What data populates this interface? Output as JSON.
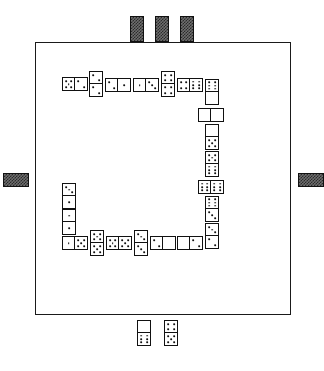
{
  "app": {
    "title": "Dominoes",
    "board_label": "Domino Table"
  },
  "colors": {
    "board_border": "#1a1a1a",
    "tile_face": "#ffffff",
    "tile_border": "#111111",
    "pip": "#111111",
    "tile_back": "#6e6e6e",
    "tile_back_hatch": "#2b2b2b",
    "page_background": "#ffffff"
  },
  "board": {
    "x": 35,
    "y": 42,
    "width": 256,
    "height": 273
  },
  "layout": {
    "tile_long": 22,
    "tile_short": 13
  },
  "layout_chain_note": "Played dominoes form an open rectangle snake running clockwise from upper-left",
  "chain": [
    {
      "id": "chain-tile-1",
      "name": "domino-5-2",
      "values": [
        5,
        2
      ],
      "orientation": "horizontal",
      "x": 62,
      "y": 77,
      "w": 26,
      "h": 14
    },
    {
      "id": "chain-tile-2",
      "name": "domino-2-2",
      "values": [
        2,
        2
      ],
      "orientation": "vertical",
      "x": 89,
      "y": 71,
      "w": 14,
      "h": 26
    },
    {
      "id": "chain-tile-3",
      "name": "domino-2-1",
      "values": [
        2,
        1
      ],
      "orientation": "horizontal",
      "x": 105,
      "y": 78,
      "w": 26,
      "h": 14
    },
    {
      "id": "chain-tile-4",
      "name": "domino-1-3",
      "values": [
        1,
        3
      ],
      "orientation": "horizontal",
      "x": 133,
      "y": 78,
      "w": 26,
      "h": 14
    },
    {
      "id": "chain-tile-5",
      "name": "domino-4-4",
      "values": [
        4,
        4
      ],
      "orientation": "vertical",
      "x": 161,
      "y": 71,
      "w": 14,
      "h": 26
    },
    {
      "id": "chain-tile-6",
      "name": "domino-4-6",
      "values": [
        4,
        6
      ],
      "orientation": "horizontal",
      "x": 177,
      "y": 78,
      "w": 26,
      "h": 14
    },
    {
      "id": "chain-tile-7",
      "name": "domino-6-blank",
      "values": [
        6,
        0
      ],
      "orientation": "vertical",
      "x": 205,
      "y": 79,
      "w": 14,
      "h": 26
    },
    {
      "id": "chain-tile-8",
      "name": "domino-blank-blank",
      "values": [
        0,
        0
      ],
      "orientation": "horizontal",
      "x": 198,
      "y": 108,
      "w": 26,
      "h": 14
    },
    {
      "id": "chain-tile-9",
      "name": "domino-blank-5",
      "values": [
        0,
        5
      ],
      "orientation": "vertical",
      "x": 205,
      "y": 124,
      "w": 14,
      "h": 26
    },
    {
      "id": "chain-tile-10",
      "name": "domino-5-6",
      "values": [
        5,
        6
      ],
      "orientation": "vertical",
      "x": 205,
      "y": 151,
      "w": 14,
      "h": 26
    },
    {
      "id": "chain-tile-11",
      "name": "domino-6-6",
      "values": [
        6,
        6
      ],
      "orientation": "horizontal",
      "x": 198,
      "y": 180,
      "w": 26,
      "h": 14
    },
    {
      "id": "chain-tile-12",
      "name": "domino-6-3",
      "values": [
        6,
        3
      ],
      "orientation": "vertical",
      "x": 205,
      "y": 196,
      "w": 14,
      "h": 26
    },
    {
      "id": "chain-tile-13",
      "name": "domino-3-2",
      "values": [
        3,
        2
      ],
      "orientation": "vertical",
      "x": 205,
      "y": 223,
      "w": 14,
      "h": 26
    },
    {
      "id": "chain-tile-14",
      "name": "domino-blank-2",
      "values": [
        0,
        2
      ],
      "orientation": "horizontal",
      "x": 177,
      "y": 236,
      "w": 26,
      "h": 14
    },
    {
      "id": "chain-tile-15",
      "name": "domino-2-blank",
      "values": [
        2,
        0
      ],
      "orientation": "horizontal",
      "x": 150,
      "y": 236,
      "w": 26,
      "h": 14
    },
    {
      "id": "chain-tile-16",
      "name": "domino-3-3",
      "values": [
        3,
        3
      ],
      "orientation": "vertical",
      "x": 134,
      "y": 230,
      "w": 14,
      "h": 26
    },
    {
      "id": "chain-tile-17",
      "name": "domino-5-5",
      "values": [
        5,
        5
      ],
      "orientation": "horizontal",
      "x": 106,
      "y": 236,
      "w": 26,
      "h": 14
    },
    {
      "id": "chain-tile-18",
      "name": "domino-5-5-b",
      "values": [
        5,
        5
      ],
      "orientation": "vertical",
      "x": 90,
      "y": 230,
      "w": 14,
      "h": 26
    },
    {
      "id": "chain-tile-19",
      "name": "domino-1-5",
      "values": [
        1,
        5
      ],
      "orientation": "horizontal",
      "x": 62,
      "y": 236,
      "w": 26,
      "h": 14
    },
    {
      "id": "chain-tile-20",
      "name": "domino-1-1",
      "values": [
        1,
        1
      ],
      "orientation": "vertical",
      "x": 62,
      "y": 209,
      "w": 14,
      "h": 26
    },
    {
      "id": "chain-tile-21",
      "name": "domino-3-1",
      "values": [
        3,
        1
      ],
      "orientation": "vertical",
      "x": 62,
      "y": 183,
      "w": 14,
      "h": 26
    }
  ],
  "hands": {
    "south": {
      "label": "Your hand",
      "face_up": true,
      "tiles": [
        {
          "id": "hand-south-1",
          "name": "domino-blank-6",
          "values": [
            0,
            6
          ],
          "orientation": "vertical",
          "x": 137,
          "y": 320,
          "w": 14,
          "h": 26
        },
        {
          "id": "hand-south-2",
          "name": "domino-4-5",
          "values": [
            4,
            5
          ],
          "orientation": "vertical",
          "x": 164,
          "y": 320,
          "w": 14,
          "h": 26
        }
      ]
    },
    "north": {
      "label": "North opponent hand",
      "face_up": false,
      "tiles": [
        {
          "id": "hand-north-1",
          "name": "domino-face-down",
          "orientation": "vertical",
          "x": 130,
          "y": 16,
          "w": 14,
          "h": 26
        },
        {
          "id": "hand-north-2",
          "name": "domino-face-down",
          "orientation": "vertical",
          "x": 155,
          "y": 16,
          "w": 14,
          "h": 26
        },
        {
          "id": "hand-north-3",
          "name": "domino-face-down",
          "orientation": "vertical",
          "x": 180,
          "y": 16,
          "w": 14,
          "h": 26
        }
      ]
    },
    "west": {
      "label": "West opponent hand",
      "face_up": false,
      "tiles": [
        {
          "id": "hand-west-1",
          "name": "domino-face-down",
          "orientation": "horizontal",
          "x": 3,
          "y": 173,
          "w": 26,
          "h": 14
        }
      ]
    },
    "east": {
      "label": "East opponent hand",
      "face_up": false,
      "tiles": [
        {
          "id": "hand-east-1",
          "name": "domino-face-down",
          "orientation": "horizontal",
          "x": 298,
          "y": 173,
          "w": 26,
          "h": 14
        }
      ]
    }
  },
  "pip_layouts": {
    "0": [],
    "1": [
      [
        50,
        50
      ]
    ],
    "2": [
      [
        26,
        26
      ],
      [
        74,
        74
      ]
    ],
    "3": [
      [
        26,
        26
      ],
      [
        50,
        50
      ],
      [
        74,
        74
      ]
    ],
    "4": [
      [
        26,
        26
      ],
      [
        74,
        26
      ],
      [
        26,
        74
      ],
      [
        74,
        74
      ]
    ],
    "5": [
      [
        26,
        26
      ],
      [
        74,
        26
      ],
      [
        50,
        50
      ],
      [
        26,
        74
      ],
      [
        74,
        74
      ]
    ],
    "6": [
      [
        26,
        22
      ],
      [
        74,
        22
      ],
      [
        26,
        50
      ],
      [
        74,
        50
      ],
      [
        26,
        78
      ],
      [
        74,
        78
      ]
    ]
  }
}
